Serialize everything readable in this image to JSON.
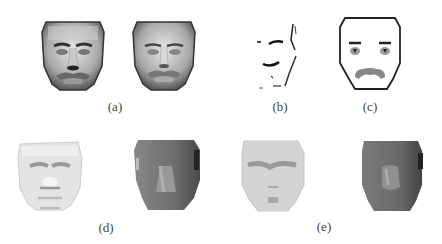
{
  "figure": {
    "panels": [
      {
        "id": "a",
        "label": "(a)",
        "description": "Two shaded 3D face renderings of a man with a mustache"
      },
      {
        "id": "b",
        "label": "(b)",
        "description": "Sparse edge/feature map of a face"
      },
      {
        "id": "c",
        "label": "(c)",
        "description": "Cartoon face outline with eyes, brows and mustache"
      },
      {
        "id": "d",
        "label": "(d)",
        "description": "Light albedo face map and dark shading/normal face map"
      },
      {
        "id": "e",
        "label": "(e)",
        "description": "Light albedo face map and dark shading/normal face map (alternate)"
      }
    ]
  }
}
